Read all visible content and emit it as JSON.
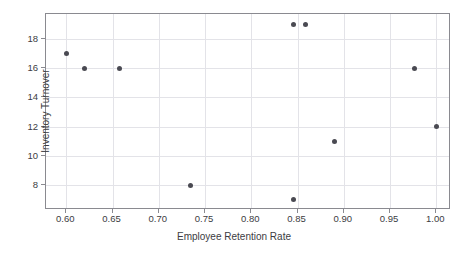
{
  "chart_data": {
    "type": "scatter",
    "title": "",
    "xlabel": "Employee Retention Rate",
    "ylabel": "Inventory Turnover",
    "xlim": [
      0.578,
      1.016
    ],
    "ylim": [
      6.3,
      19.7
    ],
    "xticks": [
      0.6,
      0.65,
      0.7,
      0.75,
      0.8,
      0.85,
      0.9,
      0.95,
      1.0
    ],
    "xtick_labels": [
      "0.60",
      "0.65",
      "0.70",
      "0.75",
      "0.80",
      "0.85",
      "0.90",
      "0.95",
      "1.00"
    ],
    "yticks": [
      8,
      10,
      12,
      14,
      16,
      18
    ],
    "ytick_labels": [
      "8",
      "10",
      "12",
      "14",
      "16",
      "18"
    ],
    "grid": true,
    "legend": "none",
    "marker_color": "#4a4a52",
    "marker_size": 5,
    "series": [
      {
        "name": "observations",
        "points": [
          {
            "x": 0.6,
            "y": 17
          },
          {
            "x": 0.62,
            "y": 16
          },
          {
            "x": 0.657,
            "y": 16
          },
          {
            "x": 0.734,
            "y": 8
          },
          {
            "x": 0.846,
            "y": 19
          },
          {
            "x": 0.859,
            "y": 19
          },
          {
            "x": 0.846,
            "y": 7
          },
          {
            "x": 0.89,
            "y": 11
          },
          {
            "x": 0.976,
            "y": 16
          },
          {
            "x": 1.0,
            "y": 12
          }
        ]
      }
    ]
  }
}
